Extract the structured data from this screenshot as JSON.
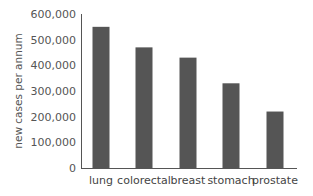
{
  "chart_data": {
    "type": "bar",
    "title": "",
    "xlabel": "",
    "ylabel": "new cases per annum",
    "categories": [
      "lung",
      "colorectal",
      "breast",
      "stomach",
      "prostate"
    ],
    "values": [
      550000,
      470000,
      430000,
      330000,
      220000
    ],
    "ylim": [
      0,
      600000
    ],
    "yticks": [
      0,
      100000,
      200000,
      300000,
      400000,
      500000,
      600000
    ],
    "ytick_labels": [
      "0",
      "100,000",
      "200,000",
      "300,000",
      "400,000",
      "500,000",
      "600,000"
    ],
    "grid": false,
    "legend": null,
    "bar_color": "#555555",
    "axis_color": "#555555"
  }
}
